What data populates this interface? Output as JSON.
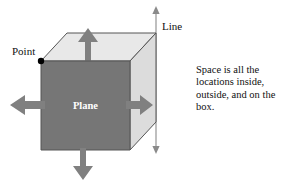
{
  "figure": {
    "labels": {
      "point": "Point",
      "line": "Line",
      "plane": "Plane"
    },
    "caption": "Space is all the locations inside, outside, and on the box.",
    "colors": {
      "front_face": "#767676",
      "top_face": "#e8e8e8",
      "right_face": "#dcdcdc",
      "edge": "#555555",
      "arrow": "#808080",
      "line_stroke": "#8a8a8a",
      "point_dot": "#000000",
      "text": "#111111",
      "plane_text": "#ffffff",
      "background": "#ffffff"
    },
    "geometry": {
      "front_face_points": "41,61 130,61 130,150 41,150",
      "top_face_points": "41,61 67,33 156,33 130,61",
      "right_face_points": "130,61 156,33 156,122 130,150",
      "point_dot_cx": 41,
      "point_dot_cy": 61,
      "point_dot_r": 3.2,
      "vertical_line_x": 156,
      "vertical_line_top_y": 10,
      "vertical_line_bottom_y": 150
    },
    "arrows": {
      "up": {
        "name": "up-arrow",
        "direction": "up"
      },
      "down": {
        "name": "down-arrow",
        "direction": "down"
      },
      "left": {
        "name": "left-arrow",
        "direction": "left"
      },
      "right": {
        "name": "right-arrow",
        "direction": "right"
      }
    }
  }
}
